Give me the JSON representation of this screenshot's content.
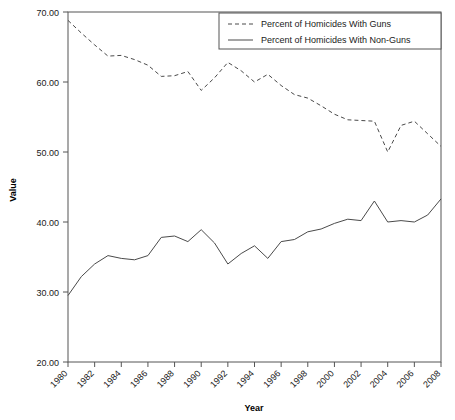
{
  "chart_data": {
    "type": "line",
    "title": "",
    "xlabel": "Year",
    "ylabel": "Value",
    "grid": false,
    "legend_position": "top-right",
    "xlim": [
      1980,
      2008
    ],
    "ylim": [
      20.0,
      70.0
    ],
    "x": [
      1980,
      1981,
      1982,
      1983,
      1984,
      1985,
      1986,
      1987,
      1988,
      1989,
      1990,
      1991,
      1992,
      1993,
      1994,
      1995,
      1996,
      1997,
      1998,
      1999,
      2000,
      2001,
      2002,
      2003,
      2004,
      2005,
      2006,
      2007,
      2008
    ],
    "x_tick_labels": [
      "1980",
      "1982",
      "1984",
      "1986",
      "1988",
      "1990",
      "1992",
      "1994",
      "1996",
      "1998",
      "2000",
      "2002",
      "2004",
      "2006",
      "2008"
    ],
    "y_tick_labels": [
      "20.00",
      "30.00",
      "40.00",
      "50.00",
      "60.00",
      "70.00"
    ],
    "y_ticks": [
      20.0,
      30.0,
      40.0,
      50.0,
      60.0,
      70.0
    ],
    "series": [
      {
        "name": "Percent of Homicides With Guns",
        "style": "dashed",
        "values": [
          68.8,
          67.0,
          65.3,
          63.7,
          63.8,
          63.2,
          62.4,
          60.8,
          60.9,
          61.5,
          58.8,
          60.6,
          62.8,
          61.6,
          60.0,
          61.1,
          59.5,
          58.2,
          57.7,
          56.6,
          55.4,
          54.6,
          54.5,
          54.4,
          50.0,
          53.8,
          54.4,
          52.6,
          50.8
        ]
      },
      {
        "name": "Percent of Homicides With Non-Guns",
        "style": "solid",
        "values": [
          29.5,
          32.2,
          34.0,
          35.2,
          34.8,
          34.6,
          35.2,
          37.8,
          38.0,
          37.2,
          38.9,
          37.0,
          34.0,
          35.5,
          36.6,
          34.8,
          37.2,
          37.5,
          38.6,
          39.0,
          39.8,
          40.4,
          40.2,
          43.0,
          40.0,
          40.2,
          40.0,
          41.0,
          43.3
        ]
      }
    ]
  },
  "legend": {
    "entries": [
      {
        "label": "Percent of Homicides With Guns",
        "style": "dashed"
      },
      {
        "label": "Percent of Homicides With Non-Guns",
        "style": "solid"
      }
    ]
  }
}
